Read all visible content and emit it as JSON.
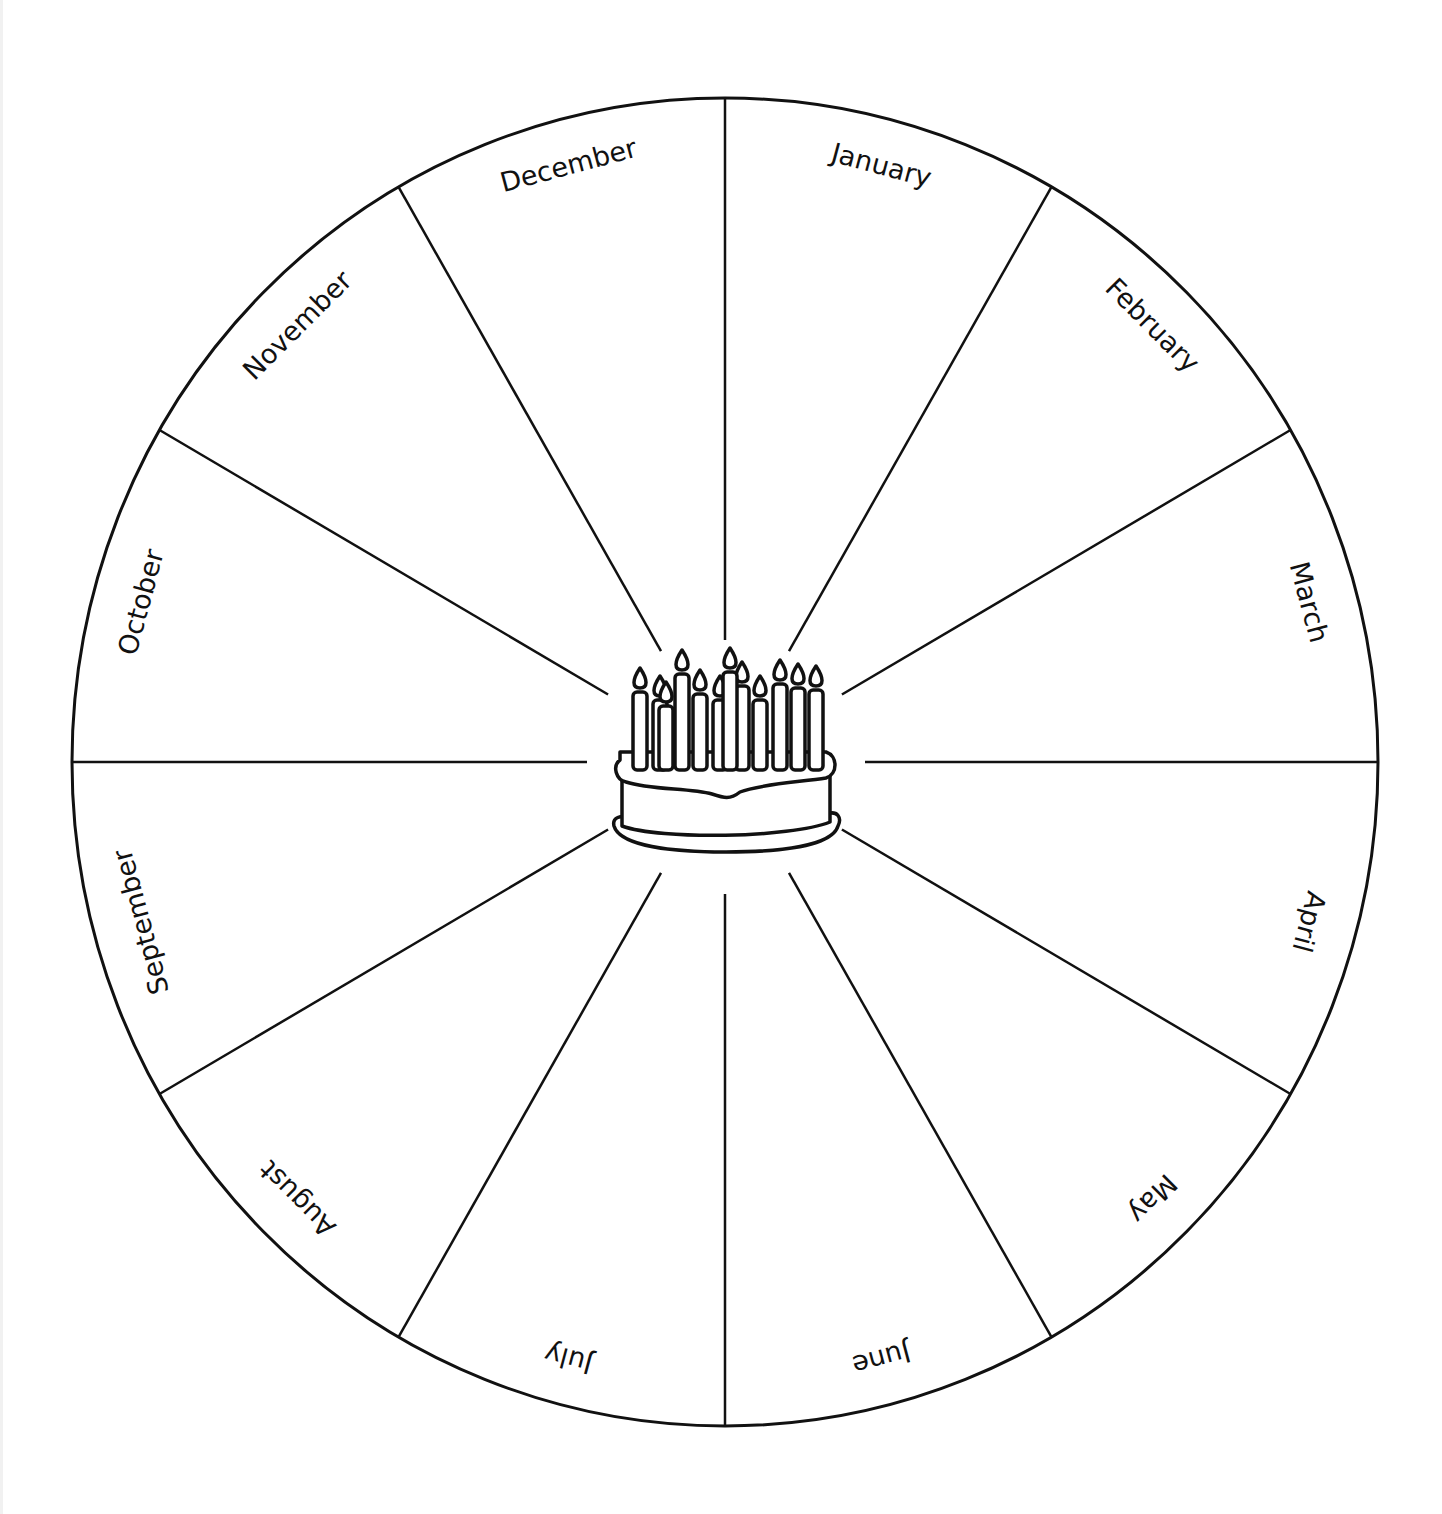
{
  "colors": {
    "ink": "#111111",
    "background": "#ffffff"
  },
  "center_icon": "birthday-cake-icon",
  "candle_count": 12,
  "months": [
    "January",
    "February",
    "March",
    "April",
    "May",
    "June",
    "July",
    "August",
    "September",
    "October",
    "November",
    "December"
  ]
}
